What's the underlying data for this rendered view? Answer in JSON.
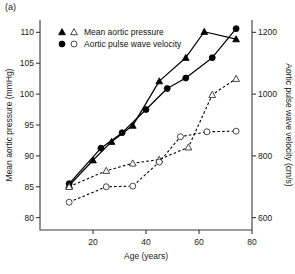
{
  "panel": {
    "label": "(a)"
  },
  "chart_data": {
    "type": "line",
    "title": "",
    "xlabel": "Age (years)",
    "ylabel": "Mean aortic pressure (mmHg)",
    "y2label": "Aortic pulse wave velocity (cm/s)",
    "xlim": [
      0,
      80
    ],
    "ylim": [
      78,
      112
    ],
    "y2lim": [
      560,
      1240
    ],
    "xticks": [
      20,
      40,
      60,
      80
    ],
    "yticks": [
      80,
      85,
      90,
      95,
      100,
      105,
      110
    ],
    "y2ticks": [
      600,
      800,
      1000,
      1200
    ],
    "grid": false,
    "legend_position": "top-left",
    "legend": [
      {
        "label": "Mean aortic pressure",
        "markers": [
          "filled-triangle",
          "open-triangle"
        ]
      },
      {
        "label": "Aortic pulse wave velocity",
        "markers": [
          "filled-circle",
          "open-circle"
        ]
      }
    ],
    "series": [
      {
        "name": "Mean aortic pressure (group 1)",
        "axis": "left",
        "marker": "filled-triangle",
        "line": "solid",
        "points": [
          {
            "x": 11,
            "y": 85.2
          },
          {
            "x": 20,
            "y": 89.3
          },
          {
            "x": 27,
            "y": 92.3
          },
          {
            "x": 35,
            "y": 94.9
          },
          {
            "x": 45,
            "y": 102.1
          },
          {
            "x": 55,
            "y": 105.9
          },
          {
            "x": 62,
            "y": 110.1
          },
          {
            "x": 74,
            "y": 108.9
          }
        ]
      },
      {
        "name": "Aortic pulse wave velocity (group 1)",
        "axis": "right",
        "marker": "filled-circle",
        "line": "solid",
        "points": [
          {
            "x": 11,
            "y": 710
          },
          {
            "x": 23,
            "y": 825
          },
          {
            "x": 31,
            "y": 875
          },
          {
            "x": 40,
            "y": 950
          },
          {
            "x": 48,
            "y": 1018
          },
          {
            "x": 55,
            "y": 1052
          },
          {
            "x": 65,
            "y": 1118
          },
          {
            "x": 74,
            "y": 1212
          }
        ]
      },
      {
        "name": "Mean aortic pressure (group 2)",
        "axis": "left",
        "marker": "open-triangle",
        "line": "dashed",
        "points": [
          {
            "x": 11,
            "y": 85.0
          },
          {
            "x": 25,
            "y": 87.6
          },
          {
            "x": 35,
            "y": 88.8
          },
          {
            "x": 45,
            "y": 89.4
          },
          {
            "x": 56,
            "y": 91.4
          },
          {
            "x": 65,
            "y": 99.9
          },
          {
            "x": 74,
            "y": 102.5
          }
        ]
      },
      {
        "name": "Aortic pulse wave velocity (group 2)",
        "axis": "right",
        "marker": "open-circle",
        "line": "dashed",
        "points": [
          {
            "x": 11,
            "y": 650
          },
          {
            "x": 25,
            "y": 700
          },
          {
            "x": 35,
            "y": 702
          },
          {
            "x": 45,
            "y": 780
          },
          {
            "x": 53,
            "y": 862
          },
          {
            "x": 63,
            "y": 878
          },
          {
            "x": 74,
            "y": 880
          }
        ]
      }
    ]
  }
}
